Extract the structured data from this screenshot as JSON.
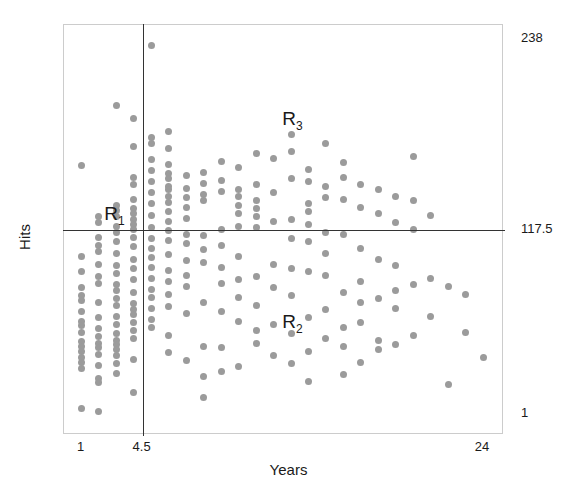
{
  "chart_data": {
    "type": "scatter",
    "title": "",
    "xlabel": "Years",
    "ylabel": "Hits",
    "xlim": [
      0,
      25.2
    ],
    "ylim": [
      -12,
      247
    ],
    "grid": false,
    "legend": null,
    "xticks": [
      {
        "value": 1,
        "label": "1"
      },
      {
        "value": 4.5,
        "label": "4.5"
      },
      {
        "value": 24,
        "label": "24"
      }
    ],
    "yticks": [
      {
        "value": 1,
        "label": "1"
      },
      {
        "value": 117.5,
        "label": "117.5"
      },
      {
        "value": 238,
        "label": "238"
      }
    ],
    "point_color": "#9b9b9b",
    "point_size_px": 7,
    "split_lines": [
      {
        "orientation": "vertical",
        "variable": "Years",
        "value": 4.5,
        "color": "#333333"
      },
      {
        "orientation": "horizontal",
        "variable": "Hits",
        "value": 117.5,
        "color": "#333333"
      }
    ],
    "annotations": [
      {
        "id": "R1",
        "text": "R",
        "subscript": "1",
        "x": 2.3,
        "y": 125
      },
      {
        "id": "R2",
        "text": "R",
        "subscript": "2",
        "x": 12.5,
        "y": 57
      },
      {
        "id": "R3",
        "text": "R",
        "subscript": "3",
        "x": 12.5,
        "y": 185
      },
      {
        "id": "Y_top",
        "text": "238",
        "x": 24,
        "y": 238
      },
      {
        "id": "Y_mid",
        "text": "117.5",
        "x": 24,
        "y": 117.5
      },
      {
        "id": "Y_bot",
        "text": "1",
        "x": 24,
        "y": 1
      }
    ],
    "series": [
      {
        "name": "players",
        "points": [
          [
            1,
            158
          ],
          [
            1,
            101
          ],
          [
            1,
            91
          ],
          [
            1,
            81
          ],
          [
            1,
            76
          ],
          [
            1,
            73
          ],
          [
            1,
            66
          ],
          [
            1,
            60
          ],
          [
            1,
            57
          ],
          [
            1,
            53
          ],
          [
            1,
            47
          ],
          [
            1,
            44
          ],
          [
            1,
            41
          ],
          [
            1,
            37
          ],
          [
            1,
            34
          ],
          [
            1,
            30
          ],
          [
            1,
            5
          ],
          [
            2,
            126
          ],
          [
            2,
            122
          ],
          [
            2,
            113
          ],
          [
            2,
            108
          ],
          [
            2,
            104
          ],
          [
            2,
            96
          ],
          [
            2,
            88
          ],
          [
            2,
            84
          ],
          [
            2,
            72
          ],
          [
            2,
            62
          ],
          [
            2,
            55
          ],
          [
            2,
            50
          ],
          [
            2,
            46
          ],
          [
            2,
            43
          ],
          [
            2,
            39
          ],
          [
            2,
            32
          ],
          [
            2,
            24
          ],
          [
            2,
            21
          ],
          [
            2,
            3
          ],
          [
            3,
            196
          ],
          [
            3,
            133
          ],
          [
            3,
            130
          ],
          [
            3,
            126
          ],
          [
            3,
            120
          ],
          [
            3,
            116
          ],
          [
            3,
            110
          ],
          [
            3,
            103
          ],
          [
            3,
            95
          ],
          [
            3,
            90
          ],
          [
            3,
            83
          ],
          [
            3,
            79
          ],
          [
            3,
            74
          ],
          [
            3,
            70
          ],
          [
            3,
            63
          ],
          [
            3,
            58
          ],
          [
            3,
            52
          ],
          [
            3,
            48
          ],
          [
            3,
            45
          ],
          [
            3,
            42
          ],
          [
            3,
            38
          ],
          [
            3,
            33
          ],
          [
            3,
            27
          ],
          [
            4,
            188
          ],
          [
            4,
            170
          ],
          [
            4,
            151
          ],
          [
            4,
            146
          ],
          [
            4,
            137
          ],
          [
            4,
            131
          ],
          [
            4,
            128
          ],
          [
            4,
            124
          ],
          [
            4,
            121
          ],
          [
            4,
            118
          ],
          [
            4,
            113
          ],
          [
            4,
            107
          ],
          [
            4,
            99
          ],
          [
            4,
            93
          ],
          [
            4,
            86
          ],
          [
            4,
            78
          ],
          [
            4,
            71
          ],
          [
            4,
            67
          ],
          [
            4,
            64
          ],
          [
            4,
            59
          ],
          [
            4,
            54
          ],
          [
            4,
            49
          ],
          [
            4,
            36
          ],
          [
            4,
            15
          ],
          [
            5,
            234
          ],
          [
            5,
            176
          ],
          [
            5,
            172
          ],
          [
            5,
            162
          ],
          [
            5,
            155
          ],
          [
            5,
            148
          ],
          [
            5,
            141
          ],
          [
            5,
            134
          ],
          [
            5,
            127
          ],
          [
            5,
            119
          ],
          [
            5,
            112
          ],
          [
            5,
            106
          ],
          [
            5,
            100
          ],
          [
            5,
            94
          ],
          [
            5,
            87
          ],
          [
            5,
            80
          ],
          [
            5,
            75
          ],
          [
            5,
            68
          ],
          [
            5,
            61
          ],
          [
            5,
            56
          ],
          [
            6,
            180
          ],
          [
            6,
            169
          ],
          [
            6,
            159
          ],
          [
            6,
            153
          ],
          [
            6,
            150
          ],
          [
            6,
            145
          ],
          [
            6,
            143
          ],
          [
            6,
            139
          ],
          [
            6,
            135
          ],
          [
            6,
            129
          ],
          [
            6,
            123
          ],
          [
            6,
            117
          ],
          [
            6,
            111
          ],
          [
            6,
            102
          ],
          [
            6,
            92
          ],
          [
            6,
            85
          ],
          [
            6,
            77
          ],
          [
            6,
            69
          ],
          [
            6,
            51
          ],
          [
            6,
            40
          ],
          [
            7,
            152
          ],
          [
            7,
            144
          ],
          [
            7,
            138
          ],
          [
            7,
            132
          ],
          [
            7,
            125
          ],
          [
            7,
            115
          ],
          [
            7,
            109
          ],
          [
            7,
            98
          ],
          [
            7,
            89
          ],
          [
            7,
            82
          ],
          [
            7,
            65
          ],
          [
            7,
            35
          ],
          [
            8,
            154
          ],
          [
            8,
            147
          ],
          [
            8,
            140
          ],
          [
            8,
            136
          ],
          [
            8,
            114
          ],
          [
            8,
            105
          ],
          [
            8,
            97
          ],
          [
            8,
            72
          ],
          [
            8,
            44
          ],
          [
            8,
            25
          ],
          [
            8,
            12
          ],
          [
            9,
            161
          ],
          [
            9,
            149
          ],
          [
            9,
            142
          ],
          [
            9,
            118
          ],
          [
            9,
            108
          ],
          [
            9,
            94
          ],
          [
            9,
            84
          ],
          [
            9,
            66
          ],
          [
            9,
            43
          ],
          [
            9,
            28
          ],
          [
            10,
            157
          ],
          [
            10,
            143
          ],
          [
            10,
            139
          ],
          [
            10,
            133
          ],
          [
            10,
            128
          ],
          [
            10,
            120
          ],
          [
            10,
            101
          ],
          [
            10,
            86
          ],
          [
            10,
            75
          ],
          [
            10,
            60
          ],
          [
            10,
            31
          ],
          [
            11,
            166
          ],
          [
            11,
            146
          ],
          [
            11,
            136
          ],
          [
            11,
            131
          ],
          [
            11,
            126
          ],
          [
            11,
            119
          ],
          [
            11,
            88
          ],
          [
            11,
            70
          ],
          [
            11,
            54
          ],
          [
            11,
            46
          ],
          [
            12,
            163
          ],
          [
            12,
            141
          ],
          [
            12,
            123
          ],
          [
            12,
            96
          ],
          [
            12,
            81
          ],
          [
            12,
            58
          ],
          [
            12,
            38
          ],
          [
            13,
            178
          ],
          [
            13,
            167
          ],
          [
            13,
            150
          ],
          [
            13,
            124
          ],
          [
            13,
            112
          ],
          [
            13,
            93
          ],
          [
            13,
            76
          ],
          [
            13,
            52
          ],
          [
            13,
            33
          ],
          [
            14,
            156
          ],
          [
            14,
            148
          ],
          [
            14,
            134
          ],
          [
            14,
            129
          ],
          [
            14,
            121
          ],
          [
            14,
            110
          ],
          [
            14,
            91
          ],
          [
            14,
            62
          ],
          [
            14,
            41
          ],
          [
            14,
            22
          ],
          [
            15,
            172
          ],
          [
            15,
            145
          ],
          [
            15,
            138
          ],
          [
            15,
            116
          ],
          [
            15,
            103
          ],
          [
            15,
            89
          ],
          [
            15,
            67
          ],
          [
            15,
            49
          ],
          [
            16,
            160
          ],
          [
            16,
            151
          ],
          [
            16,
            137
          ],
          [
            16,
            115
          ],
          [
            16,
            78
          ],
          [
            16,
            56
          ],
          [
            16,
            44
          ],
          [
            16,
            26
          ],
          [
            17,
            146
          ],
          [
            17,
            132
          ],
          [
            17,
            106
          ],
          [
            17,
            85
          ],
          [
            17,
            72
          ],
          [
            17,
            59
          ],
          [
            17,
            34
          ],
          [
            18,
            143
          ],
          [
            18,
            128
          ],
          [
            18,
            99
          ],
          [
            18,
            74
          ],
          [
            18,
            48
          ],
          [
            18,
            42
          ],
          [
            19,
            139
          ],
          [
            19,
            122
          ],
          [
            19,
            95
          ],
          [
            19,
            79
          ],
          [
            19,
            68
          ],
          [
            19,
            45
          ],
          [
            20,
            164
          ],
          [
            20,
            136
          ],
          [
            20,
            118
          ],
          [
            20,
            83
          ],
          [
            20,
            51
          ],
          [
            21,
            127
          ],
          [
            21,
            87
          ],
          [
            21,
            63
          ],
          [
            22,
            82
          ],
          [
            22,
            20
          ],
          [
            23,
            77
          ],
          [
            23,
            53
          ],
          [
            24,
            37
          ]
        ]
      }
    ]
  },
  "axes": {
    "x_title": "Years",
    "y_title": "Hits",
    "x_tick_labels": [
      "1",
      "4.5",
      "24"
    ],
    "y_tick_labels": [
      "238",
      "117.5",
      "1"
    ]
  },
  "regions": [
    {
      "name": "R",
      "sub": "1"
    },
    {
      "name": "R",
      "sub": "2"
    },
    {
      "name": "R",
      "sub": "3"
    }
  ]
}
